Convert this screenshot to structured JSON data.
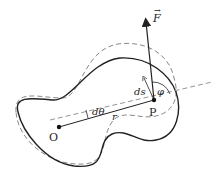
{
  "diagram": {
    "labels": {
      "force": "F",
      "point_p": "P",
      "origin": "O",
      "ds": "ds",
      "phi": "φ",
      "dtheta": "dθ",
      "r": "r"
    },
    "colors": {
      "curve": "#222222",
      "dashed": "#888888",
      "arrow": "#222222"
    }
  }
}
